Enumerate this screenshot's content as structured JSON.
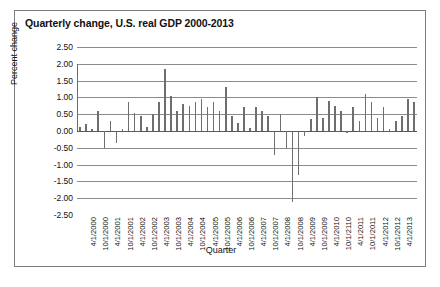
{
  "figure": {
    "title": "Quarterly change, U.S. real GDP 2000-2013",
    "caption": ""
  },
  "chart_data": {
    "type": "bar",
    "title": "Quarterly change, U.S. real GDP 2000-2013",
    "xlabel": "Quarter",
    "ylabel": "Percent change",
    "ylim": [
      -2.5,
      2.5
    ],
    "ytick_labels": [
      "2.50",
      "2.00",
      "1.50",
      "1.00",
      "0.50",
      "0.00",
      "-0.50",
      "-1.00",
      "-1.50",
      "-2.00",
      "-2.50"
    ],
    "ytick_values": [
      2.5,
      2.0,
      1.5,
      1.0,
      0.5,
      0.0,
      -0.5,
      -1.0,
      -1.5,
      -2.0,
      -2.5
    ],
    "grid": true,
    "legend": null,
    "xtick_labels": [
      "4/1/2000",
      "10/1/2000",
      "4/1/2001",
      "10/1/2001",
      "4/1/2002",
      "10/1/2002",
      "4/1/2003",
      "10/1/2003",
      "4/1/2004",
      "10/1/2004",
      "4/1/2005",
      "10/1/2005",
      "4/1/2006",
      "10/1/2006",
      "4/1/2007",
      "10/1/2007",
      "4/1/2008",
      "10/1/2008",
      "4/1/2009",
      "10/1/2009",
      "4/1/2010",
      "10/1/2110",
      "4/1/2011",
      "10/1/2011",
      "4/1/2012",
      "10/1/2012",
      "4/1/2013"
    ],
    "xtick_every": 2,
    "categories": [
      "1/1/2000",
      "4/1/2000",
      "7/1/2000",
      "10/1/2000",
      "1/1/2001",
      "4/1/2001",
      "7/1/2001",
      "10/1/2001",
      "1/1/2002",
      "4/1/2002",
      "7/1/2002",
      "10/1/2002",
      "1/1/2003",
      "4/1/2003",
      "7/1/2003",
      "10/1/2003",
      "1/1/2004",
      "4/1/2004",
      "7/1/2004",
      "10/1/2004",
      "1/1/2005",
      "4/1/2005",
      "7/1/2005",
      "10/1/2005",
      "1/1/2006",
      "4/1/2006",
      "7/1/2006",
      "10/1/2006",
      "1/1/2007",
      "4/1/2007",
      "7/1/2007",
      "10/1/2007",
      "1/1/2008",
      "4/1/2008",
      "7/1/2008",
      "10/1/2008",
      "1/1/2009",
      "4/1/2009",
      "7/1/2009",
      "10/1/2009",
      "1/1/2010",
      "4/1/2010",
      "7/1/2010",
      "10/1/2010",
      "1/1/2011",
      "4/1/2011",
      "7/1/2011",
      "10/1/2011",
      "1/1/2012",
      "4/1/2012",
      "7/1/2012",
      "10/1/2012",
      "1/1/2013",
      "4/1/2013",
      "7/1/2013",
      "10/1/2013"
    ],
    "values": [
      0.12,
      0.2,
      0.05,
      0.6,
      -0.5,
      0.3,
      -0.35,
      0.05,
      0.85,
      0.55,
      0.45,
      0.12,
      0.5,
      0.85,
      1.85,
      1.05,
      0.6,
      0.8,
      0.75,
      0.85,
      0.95,
      0.7,
      0.85,
      0.6,
      1.3,
      0.45,
      0.25,
      0.7,
      0.1,
      0.7,
      0.6,
      0.45,
      -0.7,
      0.5,
      -0.5,
      -2.1,
      -1.3,
      -0.15,
      0.35,
      1.0,
      0.4,
      0.9,
      0.75,
      0.6,
      -0.05,
      0.7,
      0.3,
      1.1,
      0.85,
      0.4,
      0.7,
      0.05,
      0.3,
      0.45,
      0.95,
      0.85
    ]
  }
}
